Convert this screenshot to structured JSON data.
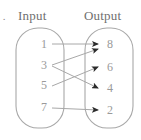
{
  "figure": {
    "marker": ".",
    "headers": {
      "input": "Input",
      "output": "Output"
    },
    "stroke_color": "#a8a8a8",
    "arrow_color": "#2b2b2b",
    "text_color": "#9a9a9a",
    "header_color": "#6f6f6f",
    "background": "#ffffff"
  },
  "input_box": {
    "name": "input-set",
    "items": [
      {
        "value": "1",
        "x": 44,
        "y": 44
      },
      {
        "value": "3",
        "x": 44,
        "y": 65
      },
      {
        "value": "5",
        "x": 44,
        "y": 85
      },
      {
        "value": "7",
        "x": 44,
        "y": 107
      }
    ],
    "shape": {
      "x": 16,
      "y": 28,
      "w": 48,
      "h": 100,
      "rx": 22
    }
  },
  "output_box": {
    "name": "output-set",
    "items": [
      {
        "value": "8",
        "x": 110,
        "y": 44
      },
      {
        "value": "6",
        "x": 110,
        "y": 67
      },
      {
        "value": "4",
        "x": 110,
        "y": 88
      },
      {
        "value": "2",
        "x": 110,
        "y": 110
      }
    ],
    "shape": {
      "x": 85,
      "y": 28,
      "w": 48,
      "h": 100,
      "rx": 22
    }
  },
  "chart_data": {
    "type": "diagram",
    "xlabel": "",
    "ylabel": "",
    "categories": [
      "1",
      "3",
      "5",
      "7"
    ],
    "mappings": [
      {
        "from": "1",
        "to": "8",
        "x1": 52,
        "y1": 44,
        "x2": 98,
        "y2": 44
      },
      {
        "from": "3",
        "to": "8",
        "x1": 52,
        "y1": 65,
        "x2": 98,
        "y2": 49
      },
      {
        "from": "3",
        "to": "4",
        "x1": 52,
        "y1": 66,
        "x2": 98,
        "y2": 88
      },
      {
        "from": "5",
        "to": "6",
        "x1": 52,
        "y1": 86,
        "x2": 98,
        "y2": 67
      },
      {
        "from": "7",
        "to": "2",
        "x1": 52,
        "y1": 108,
        "x2": 98,
        "y2": 110
      }
    ],
    "legend": [],
    "annotations": []
  }
}
